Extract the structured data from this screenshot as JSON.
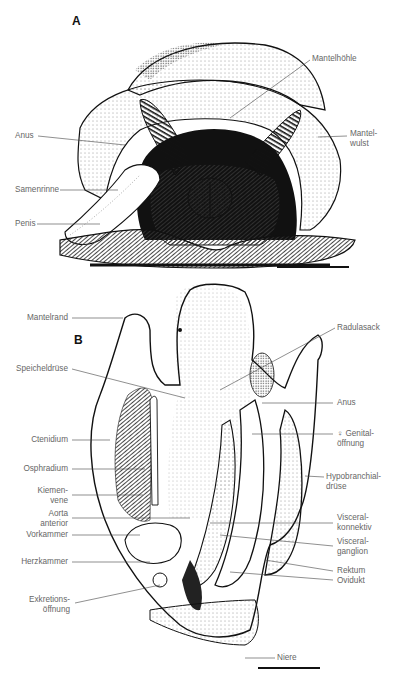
{
  "figure": {
    "panel_a": {
      "letter": "A",
      "labels": {
        "mantelhoehle": "Mantelhöhle",
        "anus": "Anus",
        "mantelwulst": "Mantel-\nwulst",
        "samenrinne": "Samenrinne",
        "penis": "Penis"
      }
    },
    "panel_b": {
      "letter": "B",
      "labels": {
        "mantelrand": "Mantelrand",
        "speicheldruese": "Speicheldrüse",
        "ctenidium": "Ctenidium",
        "osphradium": "Osphradium",
        "kiemenvene": "Kiemen-\nvene",
        "aorta": "Aorta\nanterior",
        "vorkammer": "Vorkammer",
        "herzkammer": "Herzkammer",
        "exkretion": "Exkretions-\nöffnung",
        "radulasack": "Radulasack",
        "anus": "Anus",
        "genital": "♀ Genital-\nöffnung",
        "hypobranchial": "Hypobranchial-\ndrüse",
        "visceralkonnektiv": "Visceral-\nkonnektiv",
        "visceralganglion": "Visceral-\nganglion",
        "rektum": "Rektum",
        "ovidukt": "Ovidukt",
        "niere": "Niere"
      }
    }
  }
}
